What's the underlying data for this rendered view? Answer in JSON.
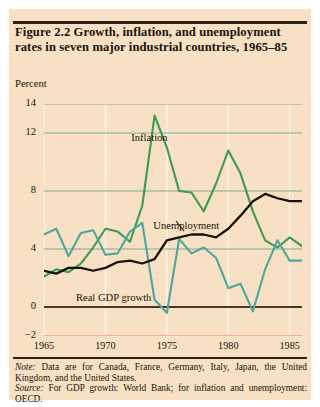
{
  "figure": {
    "title": "Figure 2.2  Growth, inflation, and unemployment rates in seven major industrial countries, 1965–85",
    "axis_unit_label": "Percent",
    "note_prefix": "Note:",
    "note_text": " Data are for Canada, France, Germany, Italy, Japan, the United Kingdom, and the United States.",
    "source_prefix": "Source:",
    "source_text": " For GDP growth: World Bank; for inflation and unemployment: OECD.",
    "colors": {
      "background": "#f7e0c4",
      "inflation": "#3d9b55",
      "gdp_growth": "#4fa79c",
      "unemployment": "#1a1208",
      "gridline": "#7fae92",
      "zero_line": "#4a3526",
      "bottom_line": "#e8a184",
      "vertical_gridline": "#fdf3e4"
    }
  },
  "chart_data": {
    "type": "line",
    "title": "Figure 2.2  Growth, inflation, and unemployment rates in seven major industrial countries, 1965–85",
    "xlabel": "",
    "ylabel": "Percent",
    "xlim": [
      1965,
      1986
    ],
    "ylim": [
      -2,
      14
    ],
    "yticks": [
      14,
      12,
      8,
      4,
      0,
      -2
    ],
    "ytick_labels": [
      "14",
      "12",
      "8",
      "4",
      "0",
      "−2"
    ],
    "xticks": [
      1965,
      1970,
      1975,
      1980,
      1985
    ],
    "xtick_labels": [
      "1965",
      "1970",
      "1975",
      "1980",
      "1985"
    ],
    "grid": "horizontal-and-vertical",
    "legend": "inline-annotations",
    "x": [
      1965,
      1966,
      1967,
      1968,
      1969,
      1970,
      1971,
      1972,
      1973,
      1974,
      1975,
      1976,
      1977,
      1978,
      1979,
      1980,
      1981,
      1982,
      1983,
      1984,
      1985,
      1986
    ],
    "series": [
      {
        "name": "Inflation",
        "color": "#3d9b55",
        "label_x": 1972.1,
        "label_y": 11.6,
        "values": [
          2.1,
          2.6,
          2.4,
          3.0,
          4.1,
          5.4,
          5.2,
          4.5,
          7.0,
          13.2,
          11.0,
          8.0,
          7.9,
          6.6,
          8.5,
          10.8,
          9.2,
          6.6,
          4.6,
          4.1,
          4.8,
          4.2
        ]
      },
      {
        "name": "Real GDP growth",
        "color": "#4fa79c",
        "label_x": 1967.6,
        "label_y": 0.55,
        "values": [
          5.0,
          5.4,
          3.5,
          5.1,
          5.3,
          3.6,
          3.7,
          5.2,
          5.8,
          0.5,
          -0.4,
          4.7,
          3.7,
          4.1,
          3.4,
          1.3,
          1.6,
          -0.3,
          2.6,
          4.6,
          3.2,
          3.2
        ]
      },
      {
        "name": "Unemployment",
        "color": "#1a1208",
        "label_x": 1973.9,
        "label_y": 5.5,
        "values": [
          2.5,
          2.3,
          2.7,
          2.7,
          2.5,
          2.7,
          3.1,
          3.2,
          3.0,
          3.3,
          4.6,
          4.8,
          5.0,
          5.0,
          4.8,
          5.4,
          6.3,
          7.3,
          7.8,
          7.5,
          7.3,
          7.3
        ]
      }
    ]
  }
}
